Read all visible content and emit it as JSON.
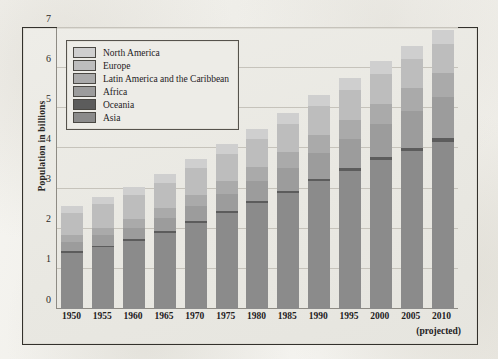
{
  "figure": {
    "y_axis_title": "Population in billions"
  },
  "chart_data": {
    "type": "bar",
    "title": "",
    "subtitle": "",
    "xlabel": "",
    "ylabel": "Population in billions",
    "stacked": true,
    "grid": true,
    "legend_position": "top-left-inside",
    "ylim": [
      0,
      7
    ],
    "yticks": [
      0,
      1,
      2,
      3,
      4,
      5,
      6,
      7
    ],
    "ytick_labels": [
      "0",
      "1",
      "2",
      "3",
      "4",
      "5",
      "6",
      "7"
    ],
    "categories": [
      "1950",
      "1955",
      "1960",
      "1965",
      "1970",
      "1975",
      "1980",
      "1985",
      "1990",
      "1995",
      "2000",
      "2005",
      "2010"
    ],
    "category_annotations": {
      "2010": "(projected)"
    },
    "series": [
      {
        "name": "Asia",
        "color": "#8b8b8b",
        "values": [
          1.4,
          1.54,
          1.7,
          1.9,
          2.14,
          2.39,
          2.64,
          2.89,
          3.18,
          3.44,
          3.7,
          3.94,
          4.17
        ]
      },
      {
        "name": "Oceania",
        "color": "#5c5c5c",
        "values": [
          0.04,
          0.04,
          0.04,
          0.05,
          0.05,
          0.05,
          0.06,
          0.06,
          0.07,
          0.07,
          0.08,
          0.08,
          0.09
        ]
      },
      {
        "name": "Africa",
        "color": "#9c9c9c",
        "values": [
          0.23,
          0.26,
          0.29,
          0.32,
          0.37,
          0.42,
          0.48,
          0.56,
          0.64,
          0.73,
          0.82,
          0.92,
          1.03
        ]
      },
      {
        "name": "Latin America and the Caribbean",
        "color": "#aaaaaa",
        "values": [
          0.17,
          0.19,
          0.22,
          0.25,
          0.29,
          0.32,
          0.36,
          0.4,
          0.44,
          0.48,
          0.52,
          0.56,
          0.59
        ]
      },
      {
        "name": "Europe",
        "color": "#bdbdbd",
        "values": [
          0.55,
          0.58,
          0.6,
          0.63,
          0.66,
          0.68,
          0.69,
          0.71,
          0.72,
          0.73,
          0.73,
          0.73,
          0.73
        ]
      },
      {
        "name": "North America",
        "color": "#cfcfcf",
        "values": [
          0.17,
          0.19,
          0.2,
          0.22,
          0.23,
          0.24,
          0.25,
          0.27,
          0.28,
          0.3,
          0.32,
          0.33,
          0.35
        ]
      }
    ],
    "totals": [
      2.56,
      2.8,
      3.05,
      3.37,
      3.74,
      4.1,
      4.48,
      4.89,
      5.33,
      5.75,
      6.17,
      6.56,
      6.96
    ]
  },
  "legend": {
    "entries": [
      {
        "label": "North America",
        "color": "#cfcfcf"
      },
      {
        "label": "Europe",
        "color": "#bdbdbd"
      },
      {
        "label": "Latin America and the Caribbean",
        "color": "#aaaaaa"
      },
      {
        "label": "Africa",
        "color": "#9c9c9c"
      },
      {
        "label": "Oceania",
        "color": "#5c5c5c"
      },
      {
        "label": "Asia",
        "color": "#8b8b8b"
      }
    ]
  }
}
